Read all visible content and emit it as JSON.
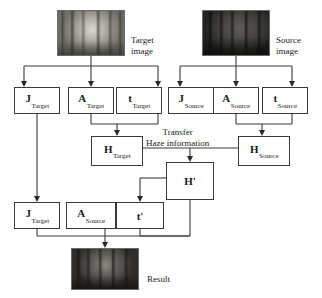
{
  "diagram": {
    "images": [
      {
        "id": "target-image",
        "caption_line1": "Target",
        "caption_line2": "image",
        "tone": "hazy-light-forest"
      },
      {
        "id": "source-image",
        "caption_line1": "Source",
        "caption_line2": "image",
        "tone": "dark-forest"
      },
      {
        "id": "result-image",
        "caption_line1": "Result",
        "caption_line2": "",
        "tone": "dark-hazy-forest"
      }
    ],
    "nodes": [
      {
        "id": "j-target-top",
        "symbol": "J",
        "subscript": "Target",
        "prime": ""
      },
      {
        "id": "a-target",
        "symbol": "A",
        "subscript": "Target",
        "prime": ""
      },
      {
        "id": "t-target",
        "symbol": "t",
        "subscript": "Target",
        "prime": ""
      },
      {
        "id": "j-source",
        "symbol": "J",
        "subscript": "Source",
        "prime": ""
      },
      {
        "id": "a-source-top",
        "symbol": "A",
        "subscript": "Source",
        "prime": ""
      },
      {
        "id": "t-source",
        "symbol": "t",
        "subscript": "Source",
        "prime": ""
      },
      {
        "id": "h-target",
        "symbol": "H",
        "subscript": "Target",
        "prime": ""
      },
      {
        "id": "h-source",
        "symbol": "H",
        "subscript": "Source",
        "prime": ""
      },
      {
        "id": "h-prime",
        "symbol": "H",
        "subscript": "",
        "prime": "'"
      },
      {
        "id": "j-target-bottom",
        "symbol": "J",
        "subscript": "Target",
        "prime": ""
      },
      {
        "id": "a-source-bottom",
        "symbol": "A",
        "subscript": "Source",
        "prime": ""
      },
      {
        "id": "t-prime",
        "symbol": "t",
        "subscript": "",
        "prime": "'"
      }
    ],
    "annotations": {
      "transfer_line1": "Transfer",
      "transfer_line2": "Haze information"
    },
    "colors": {
      "stroke": "#3a3a3a",
      "arrowhead": "#2a2a2a",
      "background": "#ffffff",
      "text": "#1a1a1a"
    }
  }
}
